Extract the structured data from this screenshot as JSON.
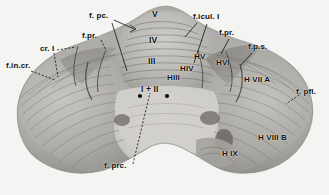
{
  "figure": {
    "kind": "anatomical-photograph",
    "background_color": "#f4f4f2",
    "label_color": "#0d0d0d"
  },
  "labels": {
    "fissures": [
      {
        "id": "f-in-cr",
        "text": "f.in.cr.",
        "x": 6,
        "y": 66
      },
      {
        "id": "cr-i",
        "text": "cr. I",
        "x": 40,
        "y": 49
      },
      {
        "id": "f-pr-left",
        "text": "f.pr.",
        "x": 84,
        "y": 36
      },
      {
        "id": "f-pc",
        "text": "f. pc.",
        "x": 91,
        "y": 16
      },
      {
        "id": "f-icul-i",
        "text": "f.icul. I",
        "x": 196,
        "y": 17
      },
      {
        "id": "f-pr-right",
        "text": "f.pr.",
        "x": 222,
        "y": 33
      },
      {
        "id": "f-p-s",
        "text": "f.p.s.",
        "x": 251,
        "y": 47
      },
      {
        "id": "f-pfl",
        "text": "f. pfl.",
        "x": 299,
        "y": 92
      },
      {
        "id": "f-prc",
        "text": "f. prc.",
        "x": 107,
        "y": 166
      }
    ],
    "vermis_lobules": [
      {
        "id": "lobule-v",
        "text": "V",
        "x": 155,
        "y": 14
      },
      {
        "id": "lobule-iv",
        "text": "IV",
        "x": 153,
        "y": 40
      },
      {
        "id": "lobule-iii",
        "text": "III",
        "x": 152,
        "y": 61
      },
      {
        "id": "lobule-i-ii",
        "text": "I + II",
        "x": 148,
        "y": 89
      }
    ],
    "hemisphere_lobules": [
      {
        "id": "h-v",
        "text": "HV",
        "x": 198,
        "y": 57
      },
      {
        "id": "h-iv",
        "text": "HIV",
        "x": 185,
        "y": 69
      },
      {
        "id": "h-iii",
        "text": "HIII",
        "x": 172,
        "y": 78
      },
      {
        "id": "h-vi",
        "text": "HVI",
        "x": 221,
        "y": 63
      },
      {
        "id": "h-vii-a",
        "text": "H VII A",
        "x": 249,
        "y": 80
      },
      {
        "id": "h-viii-b",
        "text": "H VIII B",
        "x": 263,
        "y": 138
      },
      {
        "id": "h-ix",
        "text": "H IX",
        "x": 226,
        "y": 154
      }
    ]
  },
  "leaders": [
    {
      "id": "leader-f-in-cr",
      "path": "M31,71 L55,80"
    },
    {
      "id": "leader-cr-i-a",
      "path": "M57,50 L76,47"
    },
    {
      "id": "leader-cr-i-b",
      "path": "M54,53 L58,77"
    },
    {
      "id": "leader-f-pr-l",
      "path": "M101,40 L105,50"
    },
    {
      "id": "leader-f-pc-a",
      "path": "M114,19 L133,27"
    },
    {
      "id": "leader-f-pc-b",
      "path": "M112,22 L126,70"
    },
    {
      "id": "leader-f-icul",
      "path": "M196,22 L184,36"
    },
    {
      "id": "leader-f-icul2",
      "path": "M206,23 L193,62"
    },
    {
      "id": "leader-f-pr-r",
      "path": "M229,38 L220,53"
    },
    {
      "id": "leader-f-p-s",
      "path": "M252,52 L240,64"
    },
    {
      "id": "leader-f-pfl",
      "path": "M299,95 L286,104"
    },
    {
      "id": "leader-f-prc",
      "path": "M133,164 L150,93"
    }
  ],
  "markers": [
    {
      "id": "vermis-dot-left",
      "x": 140,
      "y": 96
    },
    {
      "id": "vermis-dot-right",
      "x": 167,
      "y": 96
    }
  ]
}
